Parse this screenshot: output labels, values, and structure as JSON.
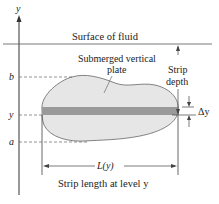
{
  "diagram": {
    "axis_label": "y",
    "surface_label": "Surface of fluid",
    "plate_label_line1": "Submerged vertical",
    "plate_label_line2": "plate",
    "strip_depth_line1": "Strip",
    "strip_depth_line2": "depth",
    "delta_y_label": "Δy",
    "level_b": "b",
    "level_y": "y",
    "level_a": "a",
    "length_label": "L(y)",
    "caption": "Strip length at level y",
    "colors": {
      "plate_fill": "#e6e6e6",
      "strip_fill": "#9a9a9a",
      "lines": "#333333"
    }
  }
}
